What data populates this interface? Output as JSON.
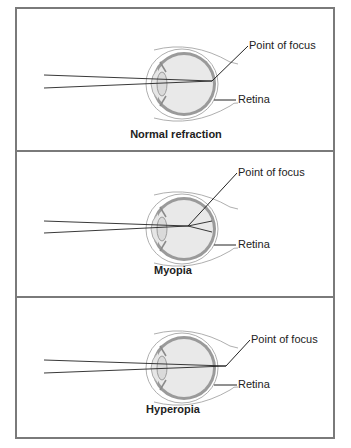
{
  "figure": {
    "panels": [
      {
        "id": "normal",
        "title": "Normal refraction",
        "focus_label": "Point of focus",
        "retina_label": "Retina",
        "focus_position": "on retina"
      },
      {
        "id": "myopia",
        "title": "Myopia",
        "focus_label": "Point of focus",
        "retina_label": "Retina",
        "focus_position": "in front of retina"
      },
      {
        "id": "hyperopia",
        "title": "Hyperopia",
        "focus_label": "Point of focus",
        "retina_label": "Retina",
        "focus_position": "behind retina"
      }
    ],
    "colors": {
      "border": "#7a7a7a",
      "eye_fill": "#e6e6e6",
      "retina": "#9a9a9a",
      "line": "#222222"
    }
  }
}
